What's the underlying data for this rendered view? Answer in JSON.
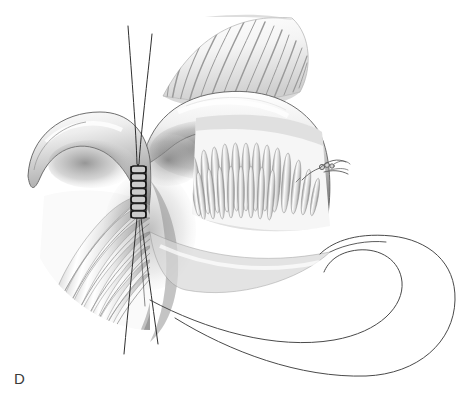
{
  "figure": {
    "panel_label": "D",
    "background_color": "#ffffff",
    "ink_color": "#3a3a3a",
    "shadow_color": "#4a4a4a",
    "tone_light": "#f2f2f2",
    "tone_mid": "#c8c8c8",
    "tone_dark": "#6e6e6e",
    "suture_color": "#2b2b2b",
    "medium": "graphite-pencil-drawing",
    "parts": [
      {
        "name": "mesenteric-fan",
        "label": "fan-shaped mesentery",
        "description": "radiating fan of folds at upper center-right",
        "ray_count": 16
      },
      {
        "name": "upper-bowel-wall",
        "label": "upper bowel wall",
        "description": "shaded curved bowel segment crossing upper middle"
      },
      {
        "name": "left-bowel-loop",
        "label": "left bowel loop",
        "description": "curved shaded loop at left with rounded apex"
      },
      {
        "name": "mucosal-folds-left",
        "label": "left mucosal folds",
        "description": "radiating valvulae conniventes at lower left",
        "fold_count": 14
      },
      {
        "name": "mucosal-folds-interior",
        "label": "interior mucosal villi",
        "description": "vertical villous folds lining the opened lumen",
        "fold_count": 22
      },
      {
        "name": "vascular-arcade",
        "label": "vascular arcade",
        "description": "fine branching vessels over the serosal surface",
        "branch_count": 9
      },
      {
        "name": "suture-line",
        "label": "running suture line",
        "description": "vertical ladder of loop stitches at anastomosis",
        "stitch_count": 7,
        "x": 138,
        "y_top": 165,
        "y_bottom": 216
      },
      {
        "name": "suture-threads",
        "label": "suture thread tails",
        "description": "two long thread tails running above and below the stitch line",
        "thread_count": 4
      },
      {
        "name": "suture-knot",
        "label": "tied suture knot",
        "description": "small knotted stitch with trailing thread at right of lumen",
        "x": 320,
        "y": 170
      },
      {
        "name": "lower-bowel-loop",
        "label": "lower bowel loop",
        "description": "large unshaded outline-only U-shaped bowel loop at lower right"
      }
    ]
  }
}
